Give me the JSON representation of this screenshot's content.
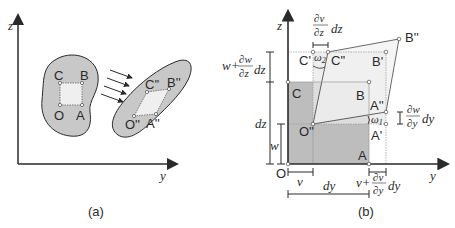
{
  "figure": {
    "panels": [
      {
        "id": "a",
        "caption": "(a)",
        "axes": {
          "vertical": "z",
          "horizontal": "y"
        },
        "body_before": {
          "points": [
            "O",
            "A",
            "B",
            "C"
          ]
        },
        "body_after": {
          "points": [
            "O''",
            "A''",
            "B''",
            "C''"
          ]
        },
        "arrows_count": 4
      },
      {
        "id": "b",
        "caption": "(b)",
        "axes": {
          "vertical": "z",
          "horizontal": "y",
          "origin": "O"
        },
        "points": {
          "O": "O",
          "A": "A",
          "B": "B",
          "C": "C",
          "O2": "O''",
          "A2": "A''",
          "B2": "B''",
          "C2": "C''",
          "A1": "A'",
          "B1": "B'",
          "C1": "C'"
        },
        "angles": {
          "omega1": "ω",
          "omega1_sub": "1",
          "omega2": "ω",
          "omega2_sub": "2"
        },
        "dimensions": {
          "v": "v",
          "w": "w",
          "dy": "dy",
          "dz": "dz",
          "dv_dz_num": "∂v",
          "dv_dz_den": "∂z",
          "dv_dz_suffix": "dz",
          "w_prefix": "w+",
          "dw_dz_num": "∂w",
          "dw_dz_den": "∂z",
          "dw_dz_suffix": "dz",
          "dw_dy_num": "∂w",
          "dw_dy_den": "∂y",
          "dw_dy_suffix": "dy",
          "v_prefix": "v+",
          "dv_dy_num": "∂v",
          "dv_dy_den": "∂y",
          "dv_dy_suffix": "dy"
        }
      }
    ],
    "colors": {
      "ink": "#2a2a2a",
      "blob_fill": "#c8c8c8",
      "square_fill": "#efefef",
      "dark_region": "#bdbdbd",
      "light_region": "#e6e6e6",
      "guide": "#9a9a9a"
    }
  }
}
